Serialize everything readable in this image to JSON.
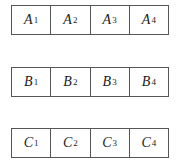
{
  "rows": [
    {
      "name": "A",
      "cells": [
        {
          "letter": "A",
          "sub": "1"
        },
        {
          "letter": "A",
          "sub": "2"
        },
        {
          "letter": "A",
          "sub": "3"
        },
        {
          "letter": "A",
          "sub": "4"
        }
      ]
    },
    {
      "name": "B",
      "cells": [
        {
          "letter": "B",
          "sub": "1"
        },
        {
          "letter": "B",
          "sub": "2"
        },
        {
          "letter": "B",
          "sub": "3"
        },
        {
          "letter": "B",
          "sub": "4"
        }
      ]
    },
    {
      "name": "C",
      "cells": [
        {
          "letter": "C",
          "sub": "1"
        },
        {
          "letter": "C",
          "sub": "2"
        },
        {
          "letter": "C",
          "sub": "3"
        },
        {
          "letter": "C",
          "sub": "4"
        }
      ]
    }
  ]
}
